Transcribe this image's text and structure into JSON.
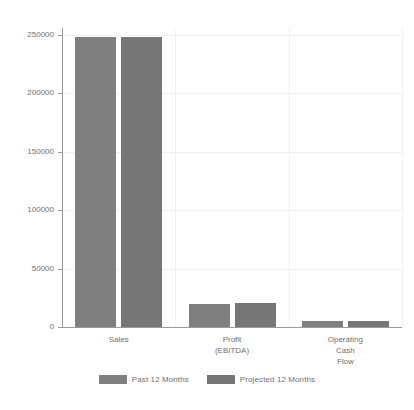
{
  "chart_data": {
    "type": "bar",
    "title": "",
    "subtitle": "",
    "xlabel": "",
    "ylabel": "",
    "categories": [
      "Sales",
      "Profit\n(EBITDA)",
      "Operating\nCash\nFlow"
    ],
    "series": [
      {
        "name": "Past 12 Months",
        "values": [
          248000,
          20000,
          5000
        ],
        "color": "#7f7f7f"
      },
      {
        "name": "Projected 12 Months",
        "values": [
          248000,
          20500,
          5000
        ],
        "color": "#767676"
      }
    ],
    "ylim": [
      0,
      250000
    ],
    "yticks": [
      0,
      50000,
      100000,
      150000,
      200000,
      250000
    ],
    "ytick_labels": [
      "0",
      "50000",
      "100000",
      "150000",
      "200000",
      "250000"
    ],
    "grid": true,
    "grid_axis": "both",
    "legend_position": "bottom",
    "background_color": "#ffffff",
    "axis_color": "#9a9a9a",
    "text_color": "#6f6f6f"
  }
}
